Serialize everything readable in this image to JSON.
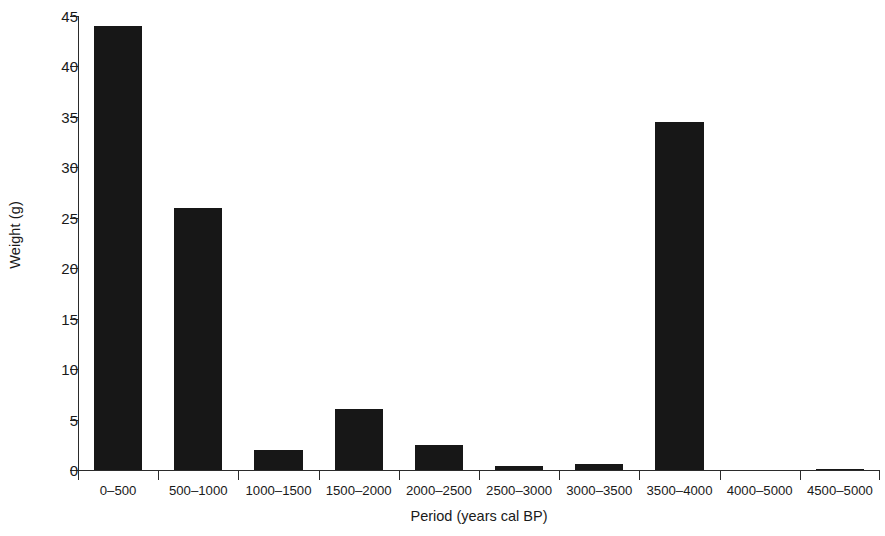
{
  "chart_data": {
    "type": "bar",
    "title": "",
    "xlabel": "Period (years cal BP)",
    "ylabel": "Weight (g)",
    "categories": [
      "0–500",
      "500–1000",
      "1000–1500",
      "1500–2000",
      "2000–2500",
      "2500–3000",
      "3000–3500",
      "3500–4000",
      "4000–5000",
      "4500–5000"
    ],
    "values": [
      44,
      26,
      2,
      6,
      2.5,
      0.4,
      0.6,
      34.5,
      0,
      0.1
    ],
    "ylim": [
      0,
      45
    ],
    "yticks": [
      0,
      5,
      10,
      15,
      20,
      25,
      30,
      35,
      40,
      45
    ],
    "ytick_labels": [
      "0",
      "5",
      "10",
      "15",
      "20",
      "25",
      "30",
      "35",
      "40",
      "45"
    ],
    "grid": false,
    "legend": null,
    "bar_color": "#171717",
    "axis_color": "#2b2b2b",
    "background": "#ffffff"
  }
}
